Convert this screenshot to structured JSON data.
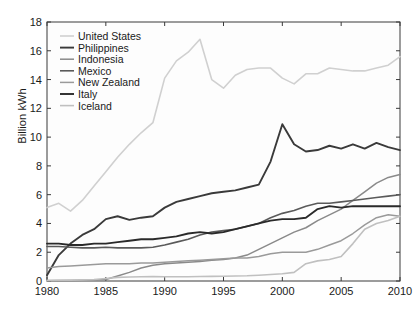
{
  "chart_data": {
    "type": "line",
    "title": "",
    "xlabel": "",
    "ylabel": "Billion kWh",
    "xlim": [
      1980,
      2010
    ],
    "ylim": [
      0,
      18
    ],
    "xticks": [
      1980,
      1985,
      1990,
      1995,
      2000,
      2005,
      2010
    ],
    "yticks": [
      0,
      2,
      4,
      6,
      8,
      10,
      12,
      14,
      16,
      18
    ],
    "grid": false,
    "legend_position": "upper left",
    "x": [
      1980,
      1981,
      1982,
      1983,
      1984,
      1985,
      1986,
      1987,
      1988,
      1989,
      1990,
      1991,
      1992,
      1993,
      1994,
      1995,
      1996,
      1997,
      1998,
      1999,
      2000,
      2001,
      2002,
      2003,
      2004,
      2005,
      2006,
      2007,
      2008,
      2009,
      2010
    ],
    "series": [
      {
        "name": "United States",
        "color": "#d0d0d0",
        "width": 1.6,
        "values": [
          5.1,
          5.4,
          4.85,
          5.6,
          6.6,
          7.6,
          8.6,
          9.5,
          10.3,
          11.0,
          14.1,
          15.3,
          15.9,
          16.8,
          14.0,
          13.4,
          14.3,
          14.7,
          14.8,
          14.8,
          14.1,
          13.7,
          14.4,
          14.4,
          14.8,
          14.7,
          14.6,
          14.6,
          14.8,
          15.0,
          15.6
        ]
      },
      {
        "name": "Philippines",
        "color": "#3a3a3a",
        "width": 1.9,
        "values": [
          0.4,
          1.8,
          2.6,
          3.2,
          3.6,
          4.3,
          4.5,
          4.25,
          4.4,
          4.5,
          5.1,
          5.5,
          5.7,
          5.9,
          6.1,
          6.2,
          6.3,
          6.5,
          6.7,
          8.3,
          10.9,
          9.5,
          9.0,
          9.1,
          9.4,
          9.2,
          9.5,
          9.2,
          9.6,
          9.3,
          9.1
        ]
      },
      {
        "name": "Indonesia",
        "color": "#8a8a8a",
        "width": 1.5,
        "values": [
          0.02,
          0.03,
          0.04,
          0.06,
          0.08,
          0.1,
          0.35,
          0.6,
          0.9,
          1.1,
          1.2,
          1.25,
          1.3,
          1.35,
          1.45,
          1.5,
          1.6,
          1.8,
          2.2,
          2.6,
          3.0,
          3.4,
          3.7,
          4.2,
          4.6,
          5.0,
          5.6,
          6.2,
          6.8,
          7.2,
          7.4
        ]
      },
      {
        "name": "Mexico",
        "color": "#5a5a5a",
        "width": 1.6,
        "values": [
          2.4,
          2.4,
          2.35,
          2.3,
          2.3,
          2.35,
          2.3,
          2.3,
          2.3,
          2.35,
          2.5,
          2.7,
          2.9,
          3.2,
          3.4,
          3.5,
          3.6,
          3.8,
          4.0,
          4.4,
          4.7,
          4.9,
          5.2,
          5.4,
          5.4,
          5.5,
          5.6,
          5.7,
          5.8,
          5.9,
          6.0
        ]
      },
      {
        "name": "New Zealand",
        "color": "#9a9a9a",
        "width": 1.5,
        "values": [
          0.9,
          1.0,
          1.05,
          1.1,
          1.15,
          1.2,
          1.2,
          1.2,
          1.25,
          1.25,
          1.3,
          1.35,
          1.4,
          1.45,
          1.5,
          1.55,
          1.6,
          1.6,
          1.7,
          1.9,
          2.0,
          2.0,
          2.0,
          2.2,
          2.5,
          2.8,
          3.3,
          3.9,
          4.4,
          4.6,
          4.5
        ]
      },
      {
        "name": "Italy",
        "color": "#2a2a2a",
        "width": 1.9,
        "values": [
          2.6,
          2.6,
          2.5,
          2.5,
          2.6,
          2.6,
          2.7,
          2.8,
          2.9,
          2.9,
          3.0,
          3.1,
          3.3,
          3.4,
          3.3,
          3.4,
          3.6,
          3.8,
          4.0,
          4.2,
          4.3,
          4.3,
          4.4,
          5.0,
          5.2,
          5.1,
          5.2,
          5.2,
          5.2,
          5.2,
          5.2
        ]
      },
      {
        "name": "Iceland",
        "color": "#c0c0c0",
        "width": 1.6,
        "values": [
          0.04,
          0.05,
          0.06,
          0.08,
          0.1,
          0.17,
          0.25,
          0.28,
          0.3,
          0.31,
          0.3,
          0.3,
          0.3,
          0.31,
          0.32,
          0.33,
          0.35,
          0.36,
          0.4,
          0.45,
          0.5,
          0.6,
          1.2,
          1.4,
          1.5,
          1.7,
          2.6,
          3.6,
          4.0,
          4.2,
          4.5
        ]
      }
    ]
  },
  "axes": {
    "ylabel": "Billion kWh",
    "ytick_labels": [
      "0",
      "2",
      "4",
      "6",
      "8",
      "10",
      "12",
      "14",
      "16",
      "18"
    ],
    "xtick_labels": [
      "1980",
      "1985",
      "1990",
      "1995",
      "2000",
      "2005",
      "2010"
    ]
  },
  "legend": {
    "items": [
      {
        "label": "United States"
      },
      {
        "label": "Philippines"
      },
      {
        "label": "Indonesia"
      },
      {
        "label": "Mexico"
      },
      {
        "label": "New Zealand"
      },
      {
        "label": "Italy"
      },
      {
        "label": "Iceland"
      }
    ]
  }
}
